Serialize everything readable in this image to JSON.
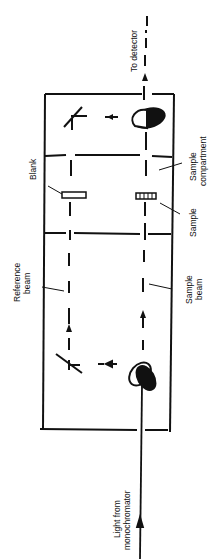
{
  "diagram": {
    "labels": {
      "to_detector": "To detector",
      "sample_compartment_line1": "Sample",
      "sample_compartment_line2": "compartment",
      "blank": "Blank",
      "sample": "Sample",
      "reference_beam_line1": "Reference",
      "reference_beam_line2": "beam",
      "sample_beam_line1": "Sample",
      "sample_beam_line2": "beam",
      "light_line1": "Light from",
      "light_line2": "monochromator"
    },
    "colors": {
      "ink": "#111111",
      "background": "#ffffff"
    }
  }
}
